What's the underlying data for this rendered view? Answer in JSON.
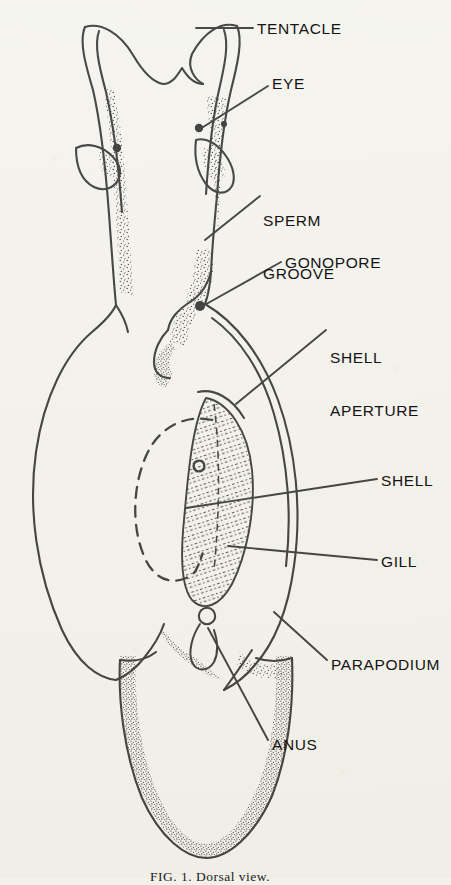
{
  "figure": {
    "type": "scientific-line-drawing",
    "background_color": "#f2f1ea",
    "ink_color": "#141414",
    "caption": "FIG. 1. Dorsal view.",
    "caption_clipped": true
  },
  "labels": [
    {
      "id": "tentacle",
      "text": "TENTACLE",
      "x": 257,
      "y": 20,
      "lines": [
        "TENTACLE"
      ]
    },
    {
      "id": "eye",
      "text": "EYE",
      "x": 272,
      "y": 75,
      "lines": [
        "EYE"
      ]
    },
    {
      "id": "sperm-groove",
      "text": "SPERM GROOVE",
      "x": 263,
      "y": 177,
      "lines": [
        "SPERM",
        "GROOVE"
      ]
    },
    {
      "id": "gonopore",
      "text": "GONOPORE",
      "x": 285,
      "y": 254,
      "lines": [
        "GONOPORE"
      ]
    },
    {
      "id": "shell-aperture",
      "text": "SHELL APERTURE",
      "x": 330,
      "y": 314,
      "lines": [
        "SHELL",
        "APERTURE"
      ]
    },
    {
      "id": "shell",
      "text": "SHELL",
      "x": 381,
      "y": 472,
      "lines": [
        "SHELL"
      ]
    },
    {
      "id": "gill",
      "text": "GILL",
      "x": 381,
      "y": 553,
      "lines": [
        "GILL"
      ]
    },
    {
      "id": "parapodium",
      "text": "PARAPODIUM",
      "x": 331,
      "y": 656,
      "lines": [
        "PARAPODIUM"
      ]
    },
    {
      "id": "anus",
      "text": "ANUS",
      "x": 272,
      "y": 736,
      "lines": [
        "ANUS"
      ]
    }
  ],
  "anatomy_parts": [
    "tentacle",
    "eye",
    "sperm groove",
    "gonopore",
    "shell aperture",
    "shell",
    "gill",
    "parapodium",
    "anus"
  ]
}
